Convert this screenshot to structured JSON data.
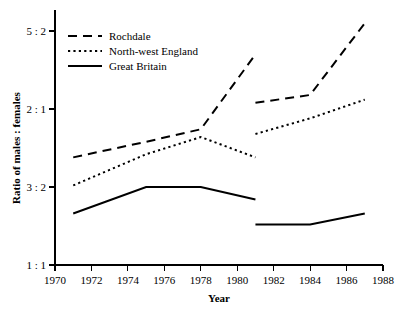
{
  "chart_data": {
    "type": "line",
    "title": "",
    "xlabel": "Year",
    "ylabel": "Ratio of males : females",
    "xlim": [
      1970,
      1988
    ],
    "ylim": [
      1.0,
      2.6
    ],
    "grid": false,
    "legend_position": "top-left",
    "xticks": [
      1970,
      1972,
      1974,
      1976,
      1978,
      1980,
      1982,
      1984,
      1986,
      1988
    ],
    "xtick_labels": [
      "1970",
      "1972",
      "1974",
      "1976",
      "1978",
      "1980",
      "1982",
      "1984",
      "1986",
      "1988"
    ],
    "yticks": [
      1.0,
      1.5,
      2.0,
      2.5
    ],
    "ytick_labels": [
      "1 : 1",
      "3 : 2",
      "2 : 1",
      "5 : 2"
    ],
    "note": "Each series is broken into two segments with a discontinuity at 1981",
    "series": [
      {
        "name": "Rochdale",
        "style": "dashed",
        "segments": [
          {
            "label": "1971-1981",
            "x": [
              1971,
              1975,
              1978,
              1981
            ],
            "y": [
              1.69,
              1.79,
              1.87,
              2.35
            ]
          },
          {
            "label": "1981-1987",
            "x": [
              1981,
              1984,
              1987
            ],
            "y": [
              2.04,
              2.09,
              2.55
            ]
          }
        ]
      },
      {
        "name": "North-west England",
        "style": "dotted",
        "segments": [
          {
            "label": "1971-1981",
            "x": [
              1971,
              1975,
              1978,
              1981
            ],
            "y": [
              1.51,
              1.71,
              1.82,
              1.69
            ]
          },
          {
            "label": "1981-1987",
            "x": [
              1981,
              1984,
              1987
            ],
            "y": [
              1.84,
              1.94,
              2.06
            ]
          }
        ]
      },
      {
        "name": "Great Britain",
        "style": "solid",
        "segments": [
          {
            "label": "1971-1981",
            "x": [
              1971,
              1975,
              1978,
              1981
            ],
            "y": [
              1.33,
              1.5,
              1.5,
              1.42
            ]
          },
          {
            "label": "1981-1987",
            "x": [
              1981,
              1984,
              1987
            ],
            "y": [
              1.26,
              1.26,
              1.33
            ]
          }
        ]
      }
    ]
  },
  "legend": {
    "items": [
      {
        "label": "Rochdale",
        "style": "dashed"
      },
      {
        "label": "North-west England",
        "style": "dotted"
      },
      {
        "label": "Great Britain",
        "style": "solid"
      }
    ]
  },
  "colors": {
    "ink": "#000000",
    "background": "#ffffff"
  }
}
